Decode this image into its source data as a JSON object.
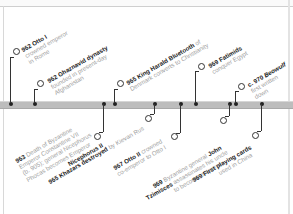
{
  "timeline": {
    "colors": {
      "bar": "#bdbdbd",
      "stem": "#333333",
      "title": "#222222",
      "desc": "#a0a0a0"
    },
    "upper_events": [
      {
        "year": "962",
        "title": "Otto I",
        "lines": [
          "crowned emperor",
          "in Rome"
        ]
      },
      {
        "year": "962",
        "title": "Ghaznavid dynasty",
        "lines": [
          "founded in present-day",
          "Afghanistan"
        ]
      },
      {
        "year": "965",
        "title": "King Harald Bluetooth",
        "title_suffix": " of",
        "lines": [
          "Denmark converts to Christianity"
        ]
      },
      {
        "year": "969",
        "title": "Fatimids",
        "lines": [
          "conquer Egypt"
        ]
      },
      {
        "year": "c. 970",
        "title": "Beowulf",
        "lines": [
          "first written",
          "down"
        ]
      }
    ],
    "lower_events": [
      {
        "year": "963",
        "title": "",
        "lines_pre": "Death of Byzantine",
        "lines": [
          "Emperor Constantine VII",
          "(b. 905); general Nicephorus",
          "Phocas becomes Emperor"
        ],
        "bold_tail": "Nicephorus II"
      },
      {
        "year": "965",
        "title": "Khazars destroyed",
        "title_suffix": " by Kievan Rus",
        "lines": []
      },
      {
        "year": "967",
        "title": "Otto II",
        "title_suffix": " crowned",
        "lines": [
          "co-emperor to Otto I"
        ]
      },
      {
        "year": "969",
        "title": "",
        "lines_pre": "Byzantine general ",
        "bold_inline": "John",
        "lines": [
          "assassinates his uncle",
          "to become emperor"
        ],
        "bold_lead": "Tzimisces"
      },
      {
        "year": "969",
        "title": "First playing cards",
        "lines": [
          "used in China"
        ]
      }
    ]
  }
}
